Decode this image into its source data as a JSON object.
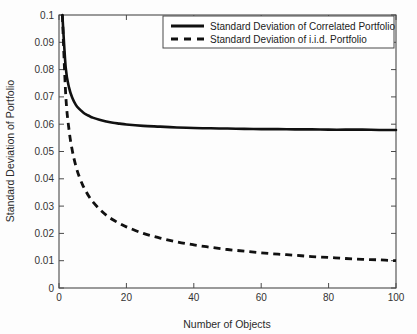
{
  "chart_data": {
    "type": "line",
    "title": "",
    "xlabel": "Number of Objects",
    "ylabel": "Standard Deviation of Portfolio",
    "xlim": [
      0,
      100
    ],
    "ylim": [
      0,
      0.1
    ],
    "xticks": [
      0,
      20,
      40,
      60,
      80,
      100
    ],
    "xtick_labels": [
      "0",
      "20",
      "40",
      "60",
      "80",
      "100"
    ],
    "yticks": [
      0,
      0.01,
      0.02,
      0.03,
      0.04,
      0.05,
      0.06,
      0.07,
      0.08,
      0.09,
      0.1
    ],
    "ytick_labels": [
      "0",
      "0.01",
      "0.02",
      "0.03",
      "0.04",
      "0.05",
      "0.06",
      "0.07",
      "0.08",
      "0.09",
      "0.1"
    ],
    "grid": false,
    "legend_position": "top-right",
    "series": [
      {
        "name": "Standard Deviation of Correlated Portfolio",
        "style": "solid",
        "color": "#111111",
        "x": [
          1,
          2,
          3,
          4,
          5,
          6,
          7,
          8,
          9,
          10,
          12,
          14,
          16,
          18,
          20,
          25,
          30,
          35,
          40,
          45,
          50,
          55,
          60,
          65,
          70,
          75,
          80,
          85,
          90,
          95,
          100
        ],
        "values": [
          0.1,
          0.0806,
          0.0733,
          0.0695,
          0.0671,
          0.0656,
          0.0645,
          0.0636,
          0.063,
          0.0624,
          0.0616,
          0.061,
          0.0605,
          0.0602,
          0.0599,
          0.0594,
          0.0591,
          0.0588,
          0.0586,
          0.0585,
          0.0584,
          0.0583,
          0.0582,
          0.0582,
          0.0581,
          0.0581,
          0.058,
          0.058,
          0.058,
          0.0579,
          0.0579
        ]
      },
      {
        "name": "Standard Deviation of i.i.d. Portfolio",
        "style": "dashed",
        "color": "#111111",
        "x": [
          1,
          2,
          3,
          4,
          5,
          6,
          7,
          8,
          9,
          10,
          12,
          14,
          16,
          18,
          20,
          25,
          30,
          35,
          40,
          45,
          50,
          55,
          60,
          65,
          70,
          75,
          80,
          85,
          90,
          95,
          100
        ],
        "values": [
          0.1,
          0.0707,
          0.0577,
          0.05,
          0.0447,
          0.0408,
          0.0378,
          0.0354,
          0.0333,
          0.0316,
          0.0289,
          0.0267,
          0.025,
          0.0236,
          0.0224,
          0.02,
          0.0183,
          0.0169,
          0.0158,
          0.0149,
          0.0141,
          0.0135,
          0.0129,
          0.0124,
          0.012,
          0.0115,
          0.0112,
          0.0108,
          0.0105,
          0.0103,
          0.01
        ]
      }
    ]
  },
  "legend": {
    "entries": [
      {
        "label": "Standard Deviation of Correlated Portfolio",
        "style": "solid"
      },
      {
        "label": "Standard Deviation of i.i.d. Portfolio",
        "style": "dashed"
      }
    ]
  }
}
